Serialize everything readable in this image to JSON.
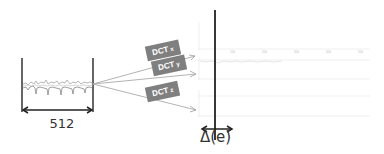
{
  "signal_box": {
    "width_label": "512"
  },
  "transforms": [
    {
      "label": "DCT",
      "sub": "x"
    },
    {
      "label": "DCT",
      "sub": "y"
    },
    {
      "label": "DCT",
      "sub": "z"
    }
  ],
  "plots": {
    "delta_label": "Δ(e)",
    "ticks": [
      "100",
      "200",
      "300",
      "400",
      "500"
    ]
  },
  "colors": {
    "box_gray": "#7f7f7f",
    "line_dark": "#222222",
    "arrow_gray": "#aaaaaa",
    "grid_light": "#e6e6e6"
  }
}
